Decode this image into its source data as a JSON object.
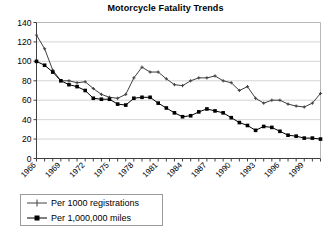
{
  "chart_data": {
    "type": "line",
    "title": "Motorcycle Fatality Trends",
    "xlabel": "",
    "ylabel": "",
    "ylim": [
      0,
      140
    ],
    "ytick_step": 20,
    "yticks": [
      0,
      20,
      40,
      60,
      80,
      100,
      120,
      140
    ],
    "grid": true,
    "grid_axis": "y",
    "legend_position": "below-left",
    "x": [
      1966,
      1967,
      1968,
      1969,
      1970,
      1971,
      1972,
      1973,
      1974,
      1975,
      1976,
      1977,
      1978,
      1979,
      1980,
      1981,
      1982,
      1983,
      1984,
      1985,
      1986,
      1987,
      1988,
      1989,
      1990,
      1991,
      1992,
      1993,
      1994,
      1995,
      1996,
      1997,
      1998,
      1999,
      2000,
      2001
    ],
    "xtick_labels": [
      "1966",
      "1969",
      "1972",
      "1975",
      "1978",
      "1981",
      "1984",
      "1987",
      "1990",
      "1993",
      "1996",
      "1999"
    ],
    "xtick_values": [
      1966,
      1969,
      1972,
      1975,
      1978,
      1981,
      1984,
      1987,
      1990,
      1993,
      1996,
      1999
    ],
    "series": [
      {
        "name": "Per 1000 registrations",
        "marker": "plus",
        "color": "#404040",
        "values": [
          127,
          113,
          91,
          80,
          80,
          78,
          79,
          72,
          66,
          63,
          62,
          66,
          83,
          94,
          89,
          89,
          82,
          76,
          75,
          80,
          83,
          83,
          85,
          80,
          78,
          70,
          74,
          62,
          57,
          60,
          60,
          56,
          54,
          53,
          57,
          67
        ]
      },
      {
        "name": "Per 1,000,000 miles",
        "marker": "square",
        "color": "#000000",
        "values": [
          100,
          96,
          89,
          80,
          76,
          74,
          70,
          62,
          61,
          61,
          56,
          55,
          62,
          63,
          63,
          57,
          52,
          47,
          43,
          44,
          48,
          51,
          49,
          47,
          42,
          37,
          34,
          29,
          33,
          32,
          28,
          24,
          23,
          21,
          21,
          20
        ]
      }
    ],
    "legend": [
      {
        "label": "Per 1000 registrations",
        "marker": "plus"
      },
      {
        "label": "Per 1,000,000 miles",
        "marker": "square"
      }
    ]
  }
}
